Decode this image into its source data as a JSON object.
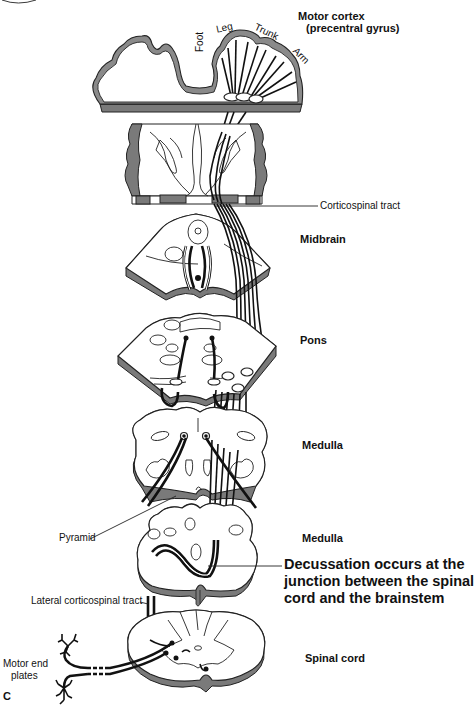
{
  "figure": {
    "panel_letter": "C",
    "labels": {
      "motor_cortex_line1": "Motor cortex",
      "motor_cortex_line2": "(precentral gyrus)",
      "foot": "Foot",
      "leg": "Leg",
      "trunk": "Trunk",
      "arm": "Arm",
      "corticospinal_tract": "Corticospinal tract",
      "midbrain": "Midbrain",
      "pons": "Pons",
      "medulla_upper": "Medulla",
      "medulla_lower": "Medulla",
      "pyramid": "Pyramid",
      "decussation_line1": "Decussation occurs at the",
      "decussation_line2": "junction between the spinal",
      "decussation_line3": "cord and the brainstem",
      "lateral_corticospinal_tract": "Lateral corticospinal tract",
      "motor_end_plates_line1": "Motor end",
      "motor_end_plates_line2": "plates",
      "spinal_cord": "Spinal cord"
    }
  }
}
